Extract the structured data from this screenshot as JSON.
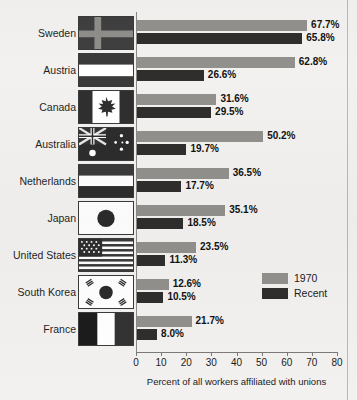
{
  "chart_data": {
    "type": "bar",
    "orientation": "horizontal",
    "title": "",
    "xlabel": "Percent of all workers affiliated with unions",
    "ylabel": "",
    "xlim": [
      0,
      80
    ],
    "xticks": [
      0,
      10,
      20,
      30,
      40,
      50,
      60,
      70,
      80
    ],
    "grid": false,
    "legend_position": "right-lower",
    "categories": [
      "Sweden",
      "Austria",
      "Canada",
      "Australia",
      "Netherlands",
      "Japan",
      "United States",
      "South Korea",
      "France"
    ],
    "series": [
      {
        "name": "1970",
        "color": "#91908d",
        "values": [
          67.7,
          62.8,
          31.6,
          50.2,
          36.5,
          35.1,
          23.5,
          12.6,
          21.7
        ],
        "labels": [
          "67.7%",
          "62.8%",
          "31.6%",
          "50.2%",
          "36.5%",
          "35.1%",
          "23.5%",
          "12.6%",
          "21.7%"
        ]
      },
      {
        "name": "Recent",
        "color": "#2f2e2c",
        "values": [
          65.8,
          26.6,
          29.5,
          19.7,
          17.7,
          18.5,
          11.3,
          10.5,
          8.0
        ],
        "labels": [
          "65.8%",
          "26.6%",
          "29.5%",
          "19.7%",
          "17.7%",
          "18.5%",
          "11.3%",
          "10.5%",
          "8.0%"
        ]
      }
    ]
  },
  "axis": {
    "tick_labels": [
      "0",
      "10",
      "20",
      "30",
      "40",
      "50",
      "60",
      "70",
      "80"
    ],
    "title": "Percent of all workers affiliated with unions"
  },
  "legend": {
    "items": [
      {
        "label": "1970",
        "color": "#91908d"
      },
      {
        "label": "Recent",
        "color": "#2f2e2c"
      }
    ]
  },
  "rows": [
    {
      "label": "Sweden",
      "flag": "flag-sweden",
      "v1970": "67.7%",
      "vrecent": "65.8%"
    },
    {
      "label": "Austria",
      "flag": "flag-austria",
      "v1970": "62.8%",
      "vrecent": "26.6%"
    },
    {
      "label": "Canada",
      "flag": "flag-canada",
      "v1970": "31.6%",
      "vrecent": "29.5%"
    },
    {
      "label": "Australia",
      "flag": "flag-australia",
      "v1970": "50.2%",
      "vrecent": "19.7%"
    },
    {
      "label": "Netherlands",
      "flag": "flag-netherlands",
      "v1970": "36.5%",
      "vrecent": "17.7%"
    },
    {
      "label": "Japan",
      "flag": "flag-japan",
      "v1970": "35.1%",
      "vrecent": "18.5%"
    },
    {
      "label": "United States",
      "flag": "flag-united-states",
      "v1970": "23.5%",
      "vrecent": "11.3%"
    },
    {
      "label": "South Korea",
      "flag": "flag-south-korea",
      "v1970": "12.6%",
      "vrecent": "10.5%"
    },
    {
      "label": "France",
      "flag": "flag-france",
      "v1970": "21.7%",
      "vrecent": "8.0%"
    }
  ],
  "colors": {
    "series_1970": "#91908d",
    "series_recent": "#2f2e2c",
    "background": "#f2f1ef",
    "axis": "#7c7a77",
    "text": "#1b1b1b"
  }
}
